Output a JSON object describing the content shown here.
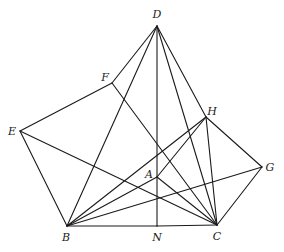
{
  "figure": {
    "type": "geometry-diagram",
    "stroke_color": "#1a1a1a",
    "background": "#ffffff"
  },
  "points": {
    "D": {
      "label": "D",
      "x": 157,
      "y": 26,
      "lx": 157,
      "ly": 18
    },
    "F": {
      "label": "F",
      "x": 112,
      "y": 83,
      "lx": 105,
      "ly": 81
    },
    "E": {
      "label": "E",
      "x": 20,
      "y": 131,
      "lx": 12,
      "ly": 135
    },
    "H": {
      "label": "H",
      "x": 206,
      "y": 117,
      "lx": 212,
      "ly": 115
    },
    "G": {
      "label": "G",
      "x": 262,
      "y": 167,
      "lx": 270,
      "ly": 171
    },
    "A": {
      "label": "A",
      "x": 157,
      "y": 177,
      "lx": 149,
      "ly": 178
    },
    "B": {
      "label": "B",
      "x": 67,
      "y": 226,
      "lx": 66,
      "ly": 241
    },
    "N": {
      "label": "N",
      "x": 157,
      "y": 226,
      "lx": 157,
      "ly": 241
    },
    "C": {
      "label": "C",
      "x": 217,
      "y": 225,
      "lx": 217,
      "ly": 240
    }
  },
  "segments": [
    [
      "D",
      "F"
    ],
    [
      "D",
      "B"
    ],
    [
      "D",
      "N"
    ],
    [
      "D",
      "C"
    ],
    [
      "D",
      "H"
    ],
    [
      "F",
      "E"
    ],
    [
      "F",
      "C"
    ],
    [
      "E",
      "B"
    ],
    [
      "E",
      "C"
    ],
    [
      "B",
      "N"
    ],
    [
      "N",
      "C"
    ],
    [
      "B",
      "H"
    ],
    [
      "B",
      "A"
    ],
    [
      "B",
      "G"
    ],
    [
      "A",
      "C"
    ],
    [
      "H",
      "C"
    ],
    [
      "H",
      "G"
    ],
    [
      "G",
      "C"
    ],
    [
      "H",
      "A"
    ]
  ]
}
